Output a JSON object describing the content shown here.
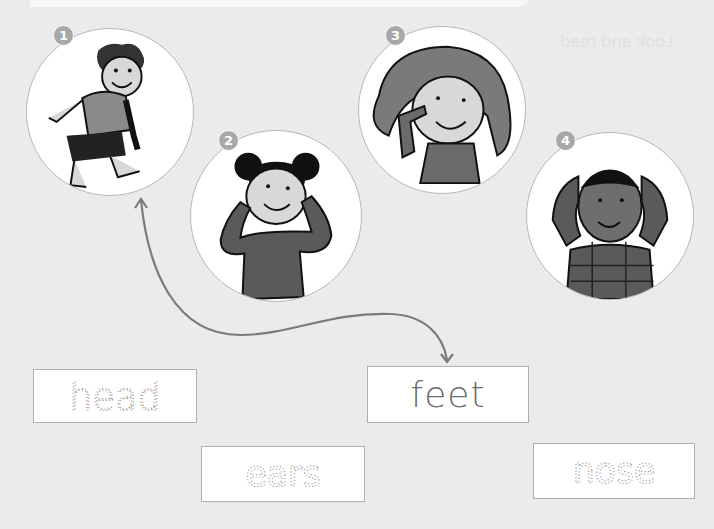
{
  "banner": {
    "badge_color": "#8c8c8c"
  },
  "bleed_through_text": "Look and read",
  "pictures": [
    {
      "number": "1",
      "description": "boy touching his feet",
      "cx": 110,
      "cy": 112,
      "r": 84,
      "badge_x": 53,
      "badge_y": 25
    },
    {
      "number": "2",
      "description": "girl touching her ears",
      "cx": 276,
      "cy": 216,
      "r": 86,
      "badge_x": 218,
      "badge_y": 130
    },
    {
      "number": "3",
      "description": "girl touching her nose",
      "cx": 442,
      "cy": 110,
      "r": 84,
      "badge_x": 385,
      "badge_y": 25
    },
    {
      "number": "4",
      "description": "boy touching his head",
      "cx": 610,
      "cy": 216,
      "r": 84,
      "badge_x": 555,
      "badge_y": 130
    }
  ],
  "words": [
    {
      "text": "head",
      "style": "dotted",
      "x": 33,
      "y": 369,
      "w": 164,
      "h": 54
    },
    {
      "text": "feet",
      "style": "solid",
      "x": 367,
      "y": 366,
      "w": 162,
      "h": 57
    },
    {
      "text": "ears",
      "style": "dotted",
      "x": 201,
      "y": 446,
      "w": 164,
      "h": 56
    },
    {
      "text": "nose",
      "style": "dotted",
      "x": 533,
      "y": 443,
      "w": 162,
      "h": 56
    }
  ],
  "connector": {
    "from": "picture-1",
    "to": "word-feet",
    "color": "#7a7a7a"
  },
  "colors": {
    "background": "#ebebeb",
    "circle_border": "#b8b8b8",
    "badge": "#a8a8a8",
    "box_border": "#b0b0b0",
    "dotted_text": "#9a9a9a",
    "solid_text": "#6e6e6e"
  }
}
